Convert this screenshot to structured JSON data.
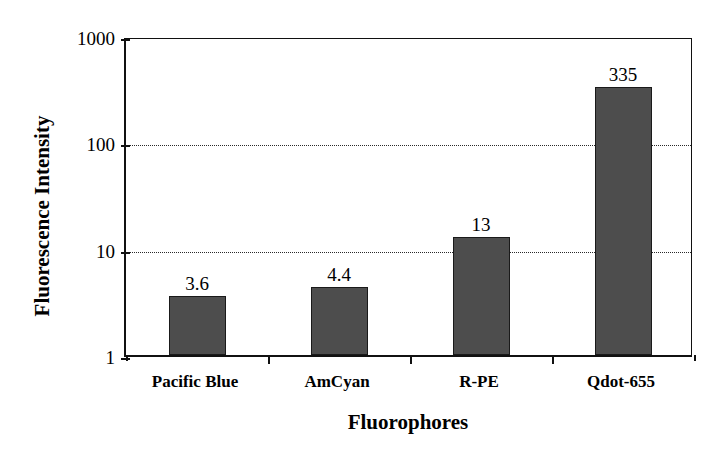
{
  "chart_data": {
    "type": "bar",
    "title": "",
    "xlabel": "Fluorophores",
    "ylabel": "Fluorescence Intensity",
    "categories": [
      "Pacific Blue",
      "AmCyan",
      "R-PE",
      "Qdot-655"
    ],
    "values": [
      3.6,
      4.4,
      13,
      335
    ],
    "value_labels": [
      "3.6",
      "4.4",
      "13",
      "335"
    ],
    "yscale": "log",
    "ylim": [
      1,
      1000
    ],
    "ytick_labels": [
      "1",
      "10",
      "100",
      "1000"
    ],
    "ytick_values": [
      1,
      10,
      100,
      1000
    ],
    "grid": "horizontal-dotted-at-10-and-100",
    "legend": "none",
    "bar_color": "#4d4d4d",
    "bar_edge_color": "#1a1a1a",
    "axis_color": "#111111",
    "background": "#ffffff"
  }
}
